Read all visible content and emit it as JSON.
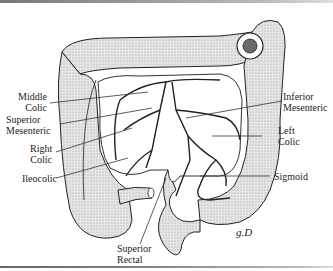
{
  "figure": {
    "labels": {
      "middle_colic": [
        "Middle",
        "Colic"
      ],
      "superior_mesenteric": [
        "Superior",
        "Mesenteric"
      ],
      "right_colic": [
        "Right",
        "Colic"
      ],
      "ileocolic": [
        "Ileocolic"
      ],
      "inferior_mesenteric": [
        "Inferior",
        "Mesenteric"
      ],
      "left_colic": [
        "Left",
        "Colic"
      ],
      "sigmoid": [
        "Sigmoid"
      ],
      "superior_rectal": [
        "Superior",
        "Rectal"
      ]
    },
    "signature": "g.D"
  },
  "colors": {
    "ink": "#222222",
    "bowel_fill": "#d9d9d9",
    "mesentery_fill": "#ffffff"
  }
}
